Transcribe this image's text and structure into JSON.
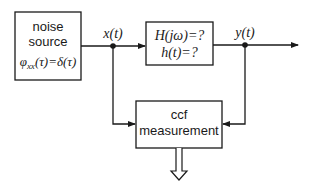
{
  "diagram": {
    "noise_source": {
      "line1": "noise",
      "line2": "source",
      "formula": "φxx(τ)=δ(τ)"
    },
    "signals": {
      "input": "x(t)",
      "output": "y(t)"
    },
    "system_block": {
      "line1": "H(jω)=?",
      "line2": "h(t)=?"
    },
    "ccf_block": {
      "line1": "ccf",
      "line2": "measurement"
    }
  }
}
